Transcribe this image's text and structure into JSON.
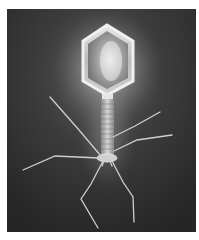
{
  "image": {
    "subject": "bacteriophage illustration",
    "style": "grayscale",
    "colors": {
      "background": "#3a3a3a",
      "background_dark": "#262626",
      "glow": "#f4f4f4",
      "head": "#d8d8d8",
      "tail": "#bdbdbd",
      "fibers": "#c8c8c8",
      "page": "#ffffff"
    }
  }
}
